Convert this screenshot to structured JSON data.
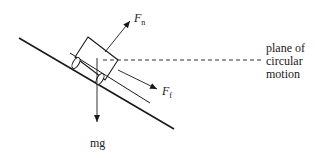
{
  "diagram": {
    "type": "free-body diagram of car on banked curve",
    "labels": {
      "normal_force": "F",
      "normal_force_sub": "n",
      "friction_force": "F",
      "friction_force_sub": "f",
      "weight": "mg",
      "plane_line1": "plane of",
      "plane_line2": "circular",
      "plane_line3": "motion"
    },
    "colors": {
      "stroke": "#1a1a1a",
      "background": "#ffffff"
    }
  }
}
